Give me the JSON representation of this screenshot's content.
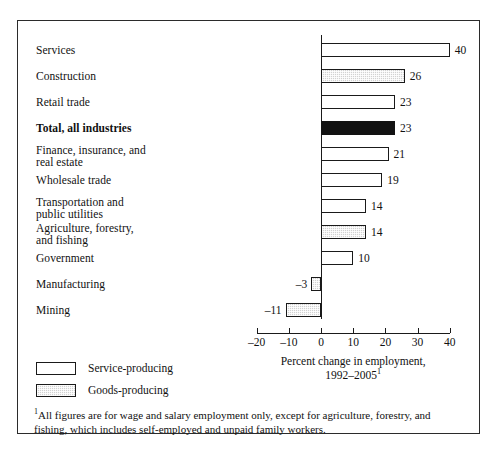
{
  "chart_data": {
    "type": "bar",
    "orientation": "horizontal",
    "title": "",
    "xlabel_line1": "Percent change in employment,",
    "xlabel_line2": "1992–2005",
    "xlabel_footnote_marker": "1",
    "ylabel": "",
    "xlim": [
      -20,
      40
    ],
    "xticks": [
      -20,
      -10,
      0,
      10,
      20,
      30,
      40
    ],
    "xtick_labels": [
      "–20",
      "–10",
      "0",
      "10",
      "20",
      "30",
      "40"
    ],
    "grid": false,
    "categories": [
      "Services",
      "Construction",
      "Retail trade",
      "Total, all industries",
      "Finance, insurance, and real estate",
      "Wholesale trade",
      "Transportation and public utilities",
      "Agriculture, forestry, and fishing",
      "Government",
      "Manufacturing",
      "Mining"
    ],
    "values": [
      40,
      26,
      23,
      23,
      21,
      19,
      14,
      14,
      10,
      -3,
      -11
    ],
    "value_labels": [
      "40",
      "26",
      "23",
      "23",
      "21",
      "19",
      "14",
      "14",
      "10",
      "–3",
      "–11"
    ],
    "bars": [
      {
        "label_line1": "Services",
        "label_line2": "",
        "value": 40,
        "value_label": "40",
        "series": "service",
        "bold": false
      },
      {
        "label_line1": "Construction",
        "label_line2": "",
        "value": 26,
        "value_label": "26",
        "series": "goods",
        "bold": false
      },
      {
        "label_line1": "Retail trade",
        "label_line2": "",
        "value": 23,
        "value_label": "23",
        "series": "service",
        "bold": false
      },
      {
        "label_line1": "Total, all industries",
        "label_line2": "",
        "value": 23,
        "value_label": "23",
        "series": "total",
        "bold": true
      },
      {
        "label_line1": "Finance, insurance, and",
        "label_line2": "real estate",
        "value": 21,
        "value_label": "21",
        "series": "service",
        "bold": false
      },
      {
        "label_line1": "Wholesale trade",
        "label_line2": "",
        "value": 19,
        "value_label": "19",
        "series": "service",
        "bold": false
      },
      {
        "label_line1": "Transportation and",
        "label_line2": "public utilities",
        "value": 14,
        "value_label": "14",
        "series": "service",
        "bold": false
      },
      {
        "label_line1": "Agriculture, forestry,",
        "label_line2": "and fishing",
        "value": 14,
        "value_label": "14",
        "series": "goods",
        "bold": false
      },
      {
        "label_line1": "Government",
        "label_line2": "",
        "value": 10,
        "value_label": "10",
        "series": "service",
        "bold": false
      },
      {
        "label_line1": "Manufacturing",
        "label_line2": "",
        "value": -3,
        "value_label": "–3",
        "series": "goods",
        "bold": false
      },
      {
        "label_line1": "Mining",
        "label_line2": "",
        "value": -11,
        "value_label": "–11",
        "series": "goods",
        "bold": false
      }
    ],
    "legend": {
      "position": "bottom-left",
      "entries": [
        {
          "label": "Service-producing",
          "series": "service"
        },
        {
          "label": "Goods-producing",
          "series": "goods"
        }
      ]
    },
    "colors": {
      "service_fill": "#ffffff",
      "goods_fill": "#d2d2d2",
      "total_fill": "#121212",
      "outline": "#1a1a1a",
      "text": "#111111"
    }
  },
  "footnote": {
    "marker": "1",
    "text": "All figures are for wage and salary employment only, except for agriculture, forestry, and fishing, which includes self-employed and unpaid family workers."
  }
}
